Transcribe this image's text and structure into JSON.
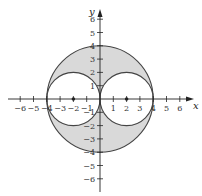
{
  "figure": {
    "axes": {
      "x_label": "x",
      "y_label": "y",
      "x_ticks": [
        "−6",
        "−5",
        "−4",
        "−3",
        "−2",
        "−1",
        "1",
        "2",
        "3",
        "4",
        "5",
        "6"
      ],
      "x_tick_values": [
        -6,
        -5,
        -4,
        -3,
        -2,
        -1,
        1,
        2,
        3,
        4,
        5,
        6
      ],
      "y_ticks": [
        "6",
        "5",
        "4",
        "3",
        "2",
        "1",
        "−1",
        "−2",
        "−3",
        "−4",
        "−5",
        "−6"
      ],
      "y_tick_values": [
        6,
        5,
        4,
        3,
        2,
        1,
        -1,
        -2,
        -3,
        -4,
        -5,
        -6
      ],
      "range": [
        -7,
        7
      ]
    },
    "shapes": {
      "outer_circle": {
        "center": [
          0,
          0
        ],
        "radius": 4
      },
      "left_circle": {
        "center": [
          -2,
          0
        ],
        "radius": 2
      },
      "right_circle": {
        "center": [
          2,
          0
        ],
        "radius": 2
      },
      "points": [
        [
          -2,
          0
        ],
        [
          2,
          0
        ]
      ]
    },
    "colors": {
      "shaded_region": "#d9d9d9",
      "curve": "#444444",
      "axis": "#222222"
    }
  }
}
